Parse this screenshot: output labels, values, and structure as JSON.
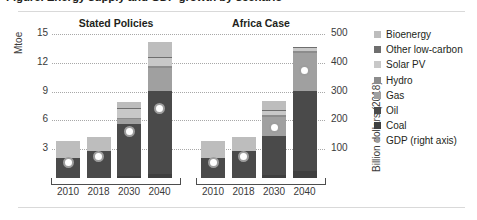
{
  "figure": {
    "title": "Figure. Energy supply and GDP growth by scenario",
    "y_left_label": "Mtoe",
    "y_right_label": "Billion dollars (2018)"
  },
  "chart_data": {
    "type": "bar",
    "title": "Figure. Energy supply and GDP growth by scenario",
    "stacked": true,
    "xlabel": "",
    "ylabel": "Mtoe",
    "ylabel_secondary": "Billion dollars (2018)",
    "ylim": [
      0,
      15
    ],
    "ylim_secondary": [
      0,
      500
    ],
    "yticks": [
      3,
      6,
      9,
      12,
      15
    ],
    "yticks_secondary": [
      100,
      200,
      300,
      400,
      500
    ],
    "grid": true,
    "legend_position": "right",
    "panels": [
      {
        "name": "Stated Policies",
        "categories": [
          "2010",
          "2018",
          "2030",
          "2040"
        ],
        "series": [
          {
            "name": "Coal",
            "color": "#3f3f3f",
            "values": [
              0.0,
              0.0,
              0.25,
              0.45
            ]
          },
          {
            "name": "Oil",
            "color": "#4a4a4a",
            "values": [
              2.05,
              2.85,
              5.35,
              8.6
            ]
          },
          {
            "name": "Gas",
            "color": "#a0a0a0",
            "values": [
              0.0,
              0.0,
              0.55,
              2.4
            ]
          },
          {
            "name": "Hydro",
            "color": "#8c8c8c",
            "values": [
              0.0,
              0.0,
              0.12,
              0.18
            ]
          },
          {
            "name": "Solar PV",
            "color": "#c8c8c8",
            "values": [
              0.0,
              0.0,
              0.95,
              0.85
            ]
          },
          {
            "name": "Other low-carbon",
            "color": "#6e6e6e",
            "values": [
              0.0,
              0.0,
              0.05,
              0.08
            ]
          },
          {
            "name": "Bioenergy",
            "color": "#bdbdbd",
            "values": [
              1.85,
              1.4,
              0.7,
              1.6
            ]
          }
        ],
        "totals": [
          3.9,
          4.25,
          8.97,
          14.16
        ],
        "gdp": {
          "name": "GDP (right axis)",
          "color": "#9d9d9d",
          "values": [
            53,
            73,
            160,
            240
          ]
        }
      },
      {
        "name": "Africa Case",
        "categories": [
          "2010",
          "2018",
          "2030",
          "2040"
        ],
        "series": [
          {
            "name": "Coal",
            "color": "#3f3f3f",
            "values": [
              0.0,
              0.0,
              0.3,
              0.75
            ]
          },
          {
            "name": "Oil",
            "color": "#4a4a4a",
            "values": [
              2.05,
              2.85,
              4.1,
              8.3
            ]
          },
          {
            "name": "Gas",
            "color": "#a0a0a0",
            "values": [
              0.0,
              0.0,
              2.0,
              4.0
            ]
          },
          {
            "name": "Hydro",
            "color": "#8c8c8c",
            "values": [
              0.0,
              0.0,
              0.12,
              0.18
            ]
          },
          {
            "name": "Solar PV",
            "color": "#c8c8c8",
            "values": [
              0.0,
              0.0,
              0.45,
              0.35
            ]
          },
          {
            "name": "Other low-carbon",
            "color": "#6e6e6e",
            "values": [
              0.0,
              0.0,
              0.08,
              0.12
            ]
          },
          {
            "name": "Bioenergy",
            "color": "#bdbdbd",
            "values": [
              1.85,
              1.4,
              0.95,
              0.0
            ]
          }
        ],
        "totals": [
          3.9,
          4.25,
          7.95,
          13.7
        ],
        "gdp": {
          "name": "GDP (right axis)",
          "color": "#9d9d9d",
          "values": [
            53,
            73,
            175,
            372
          ]
        }
      }
    ],
    "legend": [
      {
        "label": "Bioenergy",
        "color": "#bdbdbd",
        "marker": "square"
      },
      {
        "label": "Other low-carbon",
        "color": "#6e6e6e",
        "marker": "square"
      },
      {
        "label": "Solar PV",
        "color": "#c8c8c8",
        "marker": "square"
      },
      {
        "label": "Hydro",
        "color": "#8c8c8c",
        "marker": "square"
      },
      {
        "label": "Gas",
        "color": "#a0a0a0",
        "marker": "square"
      },
      {
        "label": "Oil",
        "color": "#4a4a4a",
        "marker": "square"
      },
      {
        "label": "Coal",
        "color": "#3f3f3f",
        "marker": "square"
      },
      {
        "label": "GDP (right axis)",
        "color": "#9d9d9d",
        "marker": "dot"
      }
    ]
  }
}
